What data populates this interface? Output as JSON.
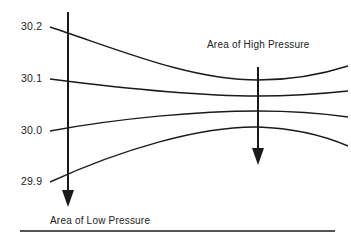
{
  "diagram": {
    "type": "isobar-pressure-diagram",
    "labels": {
      "high_pressure": "Area of High Pressure",
      "low_pressure": "Area of Low Pressure"
    },
    "isobars": [
      {
        "value": "30.2"
      },
      {
        "value": "30.1"
      },
      {
        "value": "30.0"
      },
      {
        "value": "29.9"
      }
    ],
    "colors": {
      "line": "#1a1a1a",
      "text": "#222222",
      "background": "#ffffff"
    }
  }
}
